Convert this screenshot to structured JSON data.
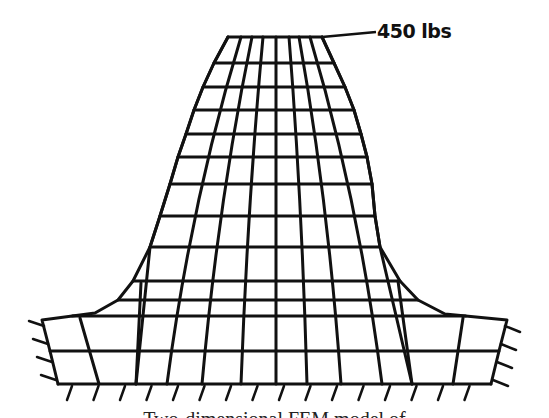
{
  "figure": {
    "load_label": "450 lbs",
    "caption_fragment": "Two-dimensional FEM model of",
    "stroke_color": "#111111",
    "background": "#ffffff",
    "mesh": {
      "top_edge": {
        "y": 37,
        "x": [
          228,
          241,
          252,
          263,
          276,
          289,
          299,
          310,
          322
        ]
      },
      "bottom_edge": {
        "y": 384,
        "x": [
          58,
          99,
          136,
          167,
          202,
          241,
          276,
          307,
          341,
          382,
          412,
          453,
          491
        ]
      },
      "horizontal_y": [
        37,
        63,
        87,
        110,
        134,
        157,
        184,
        216,
        247,
        281,
        300,
        316,
        351,
        384
      ],
      "left_boundary": [
        [
          228,
          37
        ],
        [
          214,
          63
        ],
        [
          203,
          87
        ],
        [
          194,
          110
        ],
        [
          186,
          134
        ],
        [
          178,
          157
        ],
        [
          170,
          184
        ],
        [
          160,
          216
        ],
        [
          150,
          247
        ],
        [
          133,
          281
        ],
        [
          118,
          300
        ],
        [
          95,
          313
        ],
        [
          42,
          320
        ],
        [
          50,
          351
        ],
        [
          58,
          384
        ]
      ],
      "right_boundary": [
        [
          322,
          37
        ],
        [
          334,
          63
        ],
        [
          345,
          87
        ],
        [
          354,
          110
        ],
        [
          361,
          134
        ],
        [
          367,
          157
        ],
        [
          372,
          184
        ],
        [
          375,
          216
        ],
        [
          380,
          247
        ],
        [
          400,
          281
        ],
        [
          418,
          300
        ],
        [
          445,
          314
        ],
        [
          507,
          320
        ],
        [
          499,
          351
        ],
        [
          491,
          384
        ]
      ],
      "supports": {
        "left_count": 4,
        "right_count": 4,
        "bottom_count": 16
      }
    }
  }
}
